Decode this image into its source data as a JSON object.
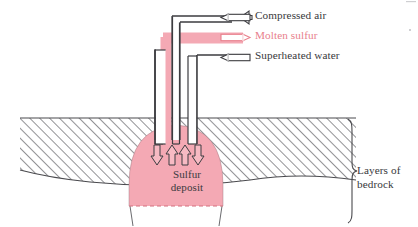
{
  "diagram": {
    "colors": {
      "sulfur_pink": "#f4a9b4",
      "sulfur_pink_light": "#f7bac3",
      "ink": "#38383c",
      "hatch": "#6e6e72",
      "white": "#ffffff"
    },
    "legend": [
      {
        "id": "compressed-air",
        "label": "Compressed air",
        "arrow": "arrow-left",
        "color": "#38383c",
        "pipe": "outer-left"
      },
      {
        "id": "molten-sulfur",
        "label": "Molten sulfur",
        "arrow": "arrow-right",
        "color": "#e8808c",
        "pipe": "middle"
      },
      {
        "id": "superheated-water",
        "label": "Superheated water",
        "arrow": "arrow-left",
        "color": "#38383c",
        "pipe": "outer-right"
      }
    ],
    "deposit": {
      "label_line1": "Sulfur",
      "label_line2": "deposit"
    },
    "bedrock": {
      "label_line1": "Layers of",
      "label_line2": "bedrock"
    },
    "flow_arrows": [
      {
        "id": "flow-arrow-1",
        "direction": "down"
      },
      {
        "id": "flow-arrow-2",
        "direction": "up"
      },
      {
        "id": "flow-arrow-3",
        "direction": "up"
      },
      {
        "id": "flow-arrow-4",
        "direction": "down"
      }
    ]
  }
}
